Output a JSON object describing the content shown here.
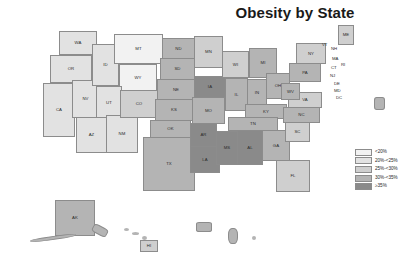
{
  "figure": {
    "title": "Obesity by State",
    "background": "#ffffff"
  },
  "chart_data": {
    "type": "choropleth-map",
    "title": "Obesity by State",
    "region": "United States",
    "value_label": "Percent of adults with obesity",
    "legend_position": "bottom-right",
    "grid": false,
    "bins": [
      {
        "label": "<20%",
        "color": "#f2f2f2",
        "class": "c1"
      },
      {
        "label": "20%-<25%",
        "color": "#e2e2e2",
        "class": "c2"
      },
      {
        "label": "25%-<30%",
        "color": "#cfcfcf",
        "class": "c3"
      },
      {
        "label": "30%-<35%",
        "color": "#b4b4b4",
        "class": "c4"
      },
      {
        "label": "≥35%",
        "color": "#8a8a8a",
        "class": "c5"
      }
    ],
    "categories": [
      "WA",
      "OR",
      "CA",
      "NV",
      "ID",
      "MT",
      "WY",
      "UT",
      "AZ",
      "NM",
      "CO",
      "ND",
      "SD",
      "NE",
      "KS",
      "OK",
      "TX",
      "MN",
      "IA",
      "MO",
      "AR",
      "LA",
      "WI",
      "IL",
      "MI",
      "IN",
      "OH",
      "KY",
      "TN",
      "MS",
      "AL",
      "GA",
      "FL",
      "SC",
      "NC",
      "VA",
      "WV",
      "MD",
      "DE",
      "PA",
      "NJ",
      "NY",
      "CT",
      "RI",
      "MA",
      "VT",
      "NH",
      "ME",
      "AK",
      "HI",
      "DC",
      "PR"
    ],
    "bin_index": [
      1,
      1,
      1,
      1,
      1,
      0,
      0,
      1,
      1,
      1,
      2,
      3,
      3,
      3,
      3,
      3,
      3,
      2,
      4,
      3,
      4,
      4,
      2,
      3,
      3,
      3,
      3,
      3,
      3,
      4,
      4,
      3,
      2,
      2,
      3,
      2,
      3,
      2,
      2,
      3,
      2,
      2,
      2,
      2,
      1,
      1,
      1,
      2,
      3,
      2,
      2,
      3
    ]
  },
  "states": [
    {
      "abbr": "WA",
      "bin": 1,
      "x": 59,
      "y": 31,
      "w": 38,
      "h": 24
    },
    {
      "abbr": "OR",
      "bin": 1,
      "x": 50,
      "y": 55,
      "w": 42,
      "h": 28
    },
    {
      "abbr": "CA",
      "bin": 1,
      "x": 43,
      "y": 83,
      "w": 32,
      "h": 54
    },
    {
      "abbr": "NV",
      "bin": 1,
      "x": 72,
      "y": 80,
      "w": 27,
      "h": 38
    },
    {
      "abbr": "ID",
      "bin": 1,
      "x": 92,
      "y": 44,
      "w": 27,
      "h": 42
    },
    {
      "abbr": "MT",
      "bin": 0,
      "x": 114,
      "y": 34,
      "w": 49,
      "h": 30
    },
    {
      "abbr": "WY",
      "bin": 0,
      "x": 119,
      "y": 64,
      "w": 38,
      "h": 27
    },
    {
      "abbr": "UT",
      "bin": 1,
      "x": 96,
      "y": 86,
      "w": 26,
      "h": 34
    },
    {
      "abbr": "AZ",
      "bin": 1,
      "x": 76,
      "y": 117,
      "w": 31,
      "h": 36
    },
    {
      "abbr": "NM",
      "bin": 1,
      "x": 106,
      "y": 115,
      "w": 32,
      "h": 38
    },
    {
      "abbr": "CO",
      "bin": 2,
      "x": 120,
      "y": 90,
      "w": 38,
      "h": 28
    },
    {
      "abbr": "ND",
      "bin": 3,
      "x": 162,
      "y": 38,
      "w": 33,
      "h": 21
    },
    {
      "abbr": "SD",
      "bin": 3,
      "x": 160,
      "y": 58,
      "w": 35,
      "h": 22
    },
    {
      "abbr": "NE",
      "bin": 3,
      "x": 157,
      "y": 79,
      "w": 38,
      "h": 21
    },
    {
      "abbr": "KS",
      "bin": 3,
      "x": 155,
      "y": 99,
      "w": 38,
      "h": 22
    },
    {
      "abbr": "OK",
      "bin": 3,
      "x": 150,
      "y": 120,
      "w": 41,
      "h": 18
    },
    {
      "abbr": "TX",
      "bin": 3,
      "x": 143,
      "y": 137,
      "w": 52,
      "h": 54
    },
    {
      "abbr": "MN",
      "bin": 2,
      "x": 194,
      "y": 36,
      "w": 29,
      "h": 32
    },
    {
      "abbr": "IA",
      "bin": 4,
      "x": 194,
      "y": 76,
      "w": 32,
      "h": 22
    },
    {
      "abbr": "MO",
      "bin": 3,
      "x": 192,
      "y": 97,
      "w": 33,
      "h": 27
    },
    {
      "abbr": "AR",
      "bin": 4,
      "x": 190,
      "y": 123,
      "w": 27,
      "h": 24
    },
    {
      "abbr": "LA",
      "bin": 4,
      "x": 190,
      "y": 146,
      "w": 30,
      "h": 27
    },
    {
      "abbr": "WI",
      "bin": 2,
      "x": 222,
      "y": 51,
      "w": 27,
      "h": 27
    },
    {
      "abbr": "IL",
      "bin": 3,
      "x": 225,
      "y": 78,
      "w": 23,
      "h": 33
    },
    {
      "abbr": "MI",
      "bin": 3,
      "x": 249,
      "y": 48,
      "w": 28,
      "h": 30
    },
    {
      "abbr": "IN",
      "bin": 3,
      "x": 247,
      "y": 79,
      "w": 20,
      "h": 27
    },
    {
      "abbr": "OH",
      "bin": 3,
      "x": 266,
      "y": 73,
      "w": 24,
      "h": 26
    },
    {
      "abbr": "KY",
      "bin": 3,
      "x": 245,
      "y": 104,
      "w": 42,
      "h": 15
    },
    {
      "abbr": "TN",
      "bin": 3,
      "x": 228,
      "y": 117,
      "w": 50,
      "h": 14
    },
    {
      "abbr": "MS",
      "bin": 4,
      "x": 216,
      "y": 131,
      "w": 22,
      "h": 34
    },
    {
      "abbr": "AL",
      "bin": 4,
      "x": 237,
      "y": 130,
      "w": 26,
      "h": 35
    },
    {
      "abbr": "GA",
      "bin": 3,
      "x": 262,
      "y": 130,
      "w": 28,
      "h": 31
    },
    {
      "abbr": "FL",
      "bin": 2,
      "x": 276,
      "y": 160,
      "w": 34,
      "h": 32
    },
    {
      "abbr": "SC",
      "bin": 2,
      "x": 285,
      "y": 122,
      "w": 25,
      "h": 20
    },
    {
      "abbr": "NC",
      "bin": 3,
      "x": 283,
      "y": 107,
      "w": 37,
      "h": 16
    },
    {
      "abbr": "VA",
      "bin": 2,
      "x": 288,
      "y": 92,
      "w": 34,
      "h": 16
    },
    {
      "abbr": "WV",
      "bin": 3,
      "x": 281,
      "y": 83,
      "w": 19,
      "h": 17
    },
    {
      "abbr": "PA",
      "bin": 3,
      "x": 289,
      "y": 63,
      "w": 32,
      "h": 19
    },
    {
      "abbr": "NY",
      "bin": 2,
      "x": 296,
      "y": 43,
      "w": 30,
      "h": 21
    },
    {
      "abbr": "ME",
      "bin": 2,
      "x": 338,
      "y": 25,
      "w": 16,
      "h": 20
    },
    {
      "abbr": "AK",
      "bin": 3,
      "x": 55,
      "y": 200,
      "w": 40,
      "h": 36
    },
    {
      "abbr": "HI",
      "bin": 2,
      "x": 140,
      "y": 240,
      "w": 18,
      "h": 12
    }
  ],
  "pin_labels": [
    {
      "abbr": "VT",
      "x": 322,
      "y": 43
    },
    {
      "abbr": "NH",
      "x": 331,
      "y": 47
    },
    {
      "abbr": "MA",
      "x": 332,
      "y": 57
    },
    {
      "abbr": "RI",
      "x": 341,
      "y": 63
    },
    {
      "abbr": "CT",
      "x": 331,
      "y": 66
    },
    {
      "abbr": "NJ",
      "x": 330,
      "y": 74
    },
    {
      "abbr": "DE",
      "x": 334,
      "y": 82
    },
    {
      "abbr": "MD",
      "x": 334,
      "y": 89
    },
    {
      "abbr": "DC",
      "x": 336,
      "y": 96
    }
  ],
  "insets": [
    {
      "name": "alaska-inset"
    },
    {
      "name": "hawaii-inset"
    },
    {
      "name": "puerto-rico-inset"
    },
    {
      "name": "guam-inset"
    }
  ]
}
